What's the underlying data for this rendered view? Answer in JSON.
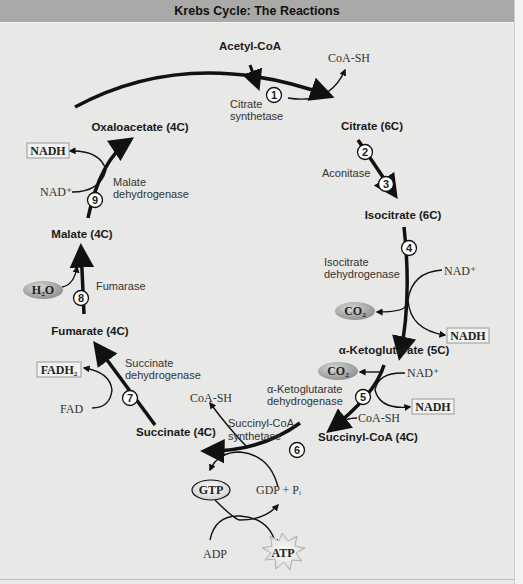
{
  "header": {
    "title": "Krebs Cycle: The Reactions"
  },
  "metabolites": {
    "acetyl_coa": "Acetyl-CoA",
    "citrate": "Citrate (6C)",
    "isocitrate": "Isocitrate (6C)",
    "alpha_kg": "α-Ketoglutarate (5C)",
    "succinyl_coa": "Succinyl-CoA (4C)",
    "succinate": "Succinate (4C)",
    "fumarate": "Fumarate (4C)",
    "malate": "Malate (4C)",
    "oxaloacetate": "Oxaloacetate (4C)"
  },
  "steps": [
    {
      "num": "1",
      "enzyme_line1": "Citrate",
      "enzyme_line2": "synthetase"
    },
    {
      "num": "2",
      "enzyme_line1": "Aconitase",
      "enzyme_line2": ""
    },
    {
      "num": "3",
      "enzyme_line1": "",
      "enzyme_line2": ""
    },
    {
      "num": "4",
      "enzyme_line1": "Isocitrate",
      "enzyme_line2": "dehydrogenase"
    },
    {
      "num": "5",
      "enzyme_line1": "α-Ketoglutarate",
      "enzyme_line2": "dehydrogenase"
    },
    {
      "num": "6",
      "enzyme_line1": "Succinyl-CoA",
      "enzyme_line2": "synthetase"
    },
    {
      "num": "7",
      "enzyme_line1": "Succinate",
      "enzyme_line2": "dehydrogenase"
    },
    {
      "num": "8",
      "enzyme_line1": "Fumarase",
      "enzyme_line2": ""
    },
    {
      "num": "9",
      "enzyme_line1": "Malate",
      "enzyme_line2": "dehydrogenase"
    }
  ],
  "side_products": {
    "coa_sh_1": "CoA-SH",
    "nad_4": "NAD⁺",
    "nadh_4": "NADH",
    "co2_4": "CO₂",
    "nad_5": "NAD⁺",
    "nadh_5": "NADH",
    "co2_5": "CO₂",
    "coa_sh_5": "CoA-SH",
    "coa_sh_6": "CoA-SH",
    "gtp": "GTP",
    "gdp_pi": "GDP + Pᵢ",
    "adp": "ADP",
    "atp": "ATP",
    "fadh2": "FADH₂",
    "fad": "FAD",
    "h2o": "H₂O",
    "nad_9": "NAD⁺",
    "nadh_9": "NADH"
  },
  "colors": {
    "header_bg": "#a9a9a8",
    "panel_bg": "#e8e8e6",
    "arrow": "#111111",
    "co2_bubble": "#9a9a98",
    "nadh_box": "#f2f2f0"
  }
}
